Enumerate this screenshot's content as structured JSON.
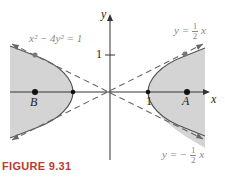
{
  "figure": {
    "caption_word": "Figure",
    "caption_number": "9.31",
    "equation": "x² − 4y² = 1",
    "asymptote_upper": {
      "lhs": "y =",
      "num": "1",
      "den": "2",
      "var": "x"
    },
    "asymptote_lower": {
      "lhs": "y = −",
      "num": "1",
      "den": "2",
      "var": "x"
    },
    "axis_x_label": "x",
    "axis_y_label": "y",
    "tick_x_label": "1",
    "tick_y_label": "1",
    "point_a_label": "A",
    "point_b_label": "B",
    "colors": {
      "shade": "#d4d4d4",
      "curve": "#555555",
      "asymptote": "#666666",
      "caption": "#c0392b",
      "point": "#111111"
    }
  }
}
